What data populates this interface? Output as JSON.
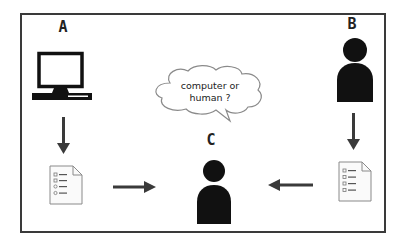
{
  "diagram": {
    "type": "turing-test-illustration",
    "frame": {
      "border_color": "#3a3a3a"
    },
    "nodes": {
      "a": {
        "label": "A",
        "icon": "computer-icon"
      },
      "b": {
        "label": "B",
        "icon": "person-icon"
      },
      "c": {
        "label": "C",
        "icon": "person-icon"
      }
    },
    "documents": [
      {
        "icon": "document-checklist-icon",
        "owner": "A"
      },
      {
        "icon": "document-checklist-icon",
        "owner": "B"
      }
    ],
    "thought_bubble": {
      "owner": "C",
      "line1": "computer or",
      "line2": "human ?"
    },
    "edges": [
      {
        "from": "A",
        "to": "document-A",
        "direction": "down"
      },
      {
        "from": "B",
        "to": "document-B",
        "direction": "down"
      },
      {
        "from": "document-A",
        "to": "C",
        "direction": "right"
      },
      {
        "from": "document-B",
        "to": "C",
        "direction": "left"
      }
    ],
    "colors": {
      "icon_fill": "#111111",
      "arrow": "#3a3a3a",
      "doc_stroke": "#8a8a8a",
      "cloud_stroke": "#8a8a8a"
    }
  }
}
